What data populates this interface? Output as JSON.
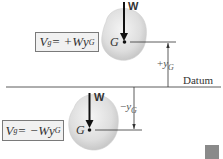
{
  "diagram": {
    "top": {
      "formula": {
        "lhs": "V",
        "lhs_sub": "g",
        "eq": " = +W",
        "y": "y",
        "y_sub": "G"
      },
      "force_label": "W",
      "center_label": "G",
      "dimension": {
        "sign": "+",
        "symbol": "y",
        "sub": "G"
      }
    },
    "datum_label": "Datum",
    "bottom": {
      "formula": {
        "lhs": "V",
        "lhs_sub": "g",
        "eq": " = −W",
        "y": "y",
        "y_sub": "G"
      },
      "force_label": "W",
      "center_label": "G",
      "dimension": {
        "sign": "−",
        "symbol": "y",
        "sub": "G"
      }
    },
    "colors": {
      "body_fill": "#d9d9d9",
      "line": "#222222",
      "box_fill": "#f1f1f1",
      "box_border": "#7a7a7a",
      "corner_square": "#8a8a8a"
    }
  }
}
